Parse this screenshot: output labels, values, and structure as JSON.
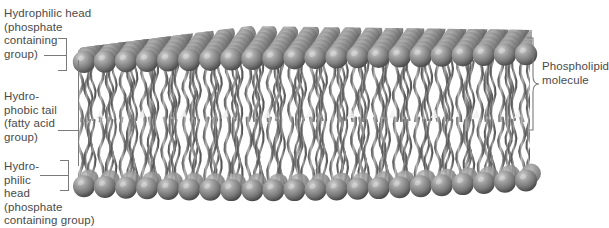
{
  "diagram": {
    "type": "cross-section illustration",
    "colors": {
      "head_sphere": "#8a8a8a",
      "head_highlight": "#c8c8c8",
      "head_shadow": "#4e4e4e",
      "tail": "#9a9a9a",
      "tail_dark": "#5c5c5c",
      "background": "#ffffff",
      "text": "#4a4a4a",
      "leader_line": "#7a7a7a"
    }
  },
  "labels": {
    "hydrophilic_head_top": "Hydrophilic head\n(phosphate\ncontaining\ngroup)",
    "hydrophobic_tail": "Hydro-\nphobic tail\n(fatty acid\ngroup)",
    "hydrophilic_head_bottom": "Hydro-\nphilic\nhead\n(phosphate\ncontaining group)",
    "phospholipid_molecule": "Phospholipid\nmolecule"
  },
  "structure": {
    "layers": [
      {
        "name": "upper-head-layer",
        "description": "row of spherical phosphate head groups"
      },
      {
        "name": "upper-tail-layer",
        "description": "wavy hydrophobic fatty acid tails"
      },
      {
        "name": "lower-tail-layer",
        "description": "wavy hydrophobic fatty acid tails"
      },
      {
        "name": "lower-head-layer",
        "description": "row of spherical phosphate head groups"
      }
    ],
    "head_count_front_row": 22,
    "head_rows_perspective": 6
  }
}
